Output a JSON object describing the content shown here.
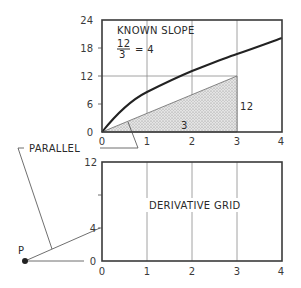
{
  "top_plot": {
    "annotation_title": "KNOWN SLOPE",
    "fraction_numerator": "12",
    "fraction_denominator": "3",
    "fraction_result": "= 4",
    "rise_label": "12",
    "run_label": "3",
    "y_ticks": [
      "0",
      "6",
      "12",
      "18",
      "24"
    ],
    "x_ticks": [
      "0",
      "1",
      "2",
      "3",
      "4"
    ]
  },
  "bottom_plot": {
    "title": "DERIVATIVE GRID",
    "y_ticks": [
      "0",
      "4",
      "12"
    ],
    "x_ticks": [
      "0",
      "1",
      "2",
      "3",
      "4"
    ]
  },
  "labels": {
    "parallel": "PARALLEL",
    "pole": "P"
  },
  "colors": {
    "ink": "#2a2a2a",
    "grid": "#8a8a8a",
    "shading": "#d8d8d8"
  }
}
